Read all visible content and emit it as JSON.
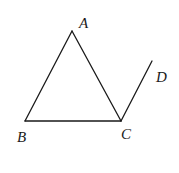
{
  "diagram": {
    "type": "geometry",
    "stroke_color": "#1a1a1a",
    "background": "#ffffff",
    "points": {
      "A": {
        "label": "A",
        "x": 72,
        "y": 31,
        "label_x": 79,
        "label_y": 28
      },
      "B": {
        "label": "B",
        "x": 25,
        "y": 121,
        "label_x": 17,
        "label_y": 142
      },
      "C": {
        "label": "C",
        "x": 121,
        "y": 121,
        "label_x": 121,
        "label_y": 139
      },
      "D": {
        "label": "D",
        "x": 152,
        "y": 61,
        "label_x": 156,
        "label_y": 82
      }
    },
    "segments": [
      {
        "from": "A",
        "to": "B"
      },
      {
        "from": "B",
        "to": "C"
      },
      {
        "from": "C",
        "to": "A"
      },
      {
        "from": "C",
        "to": "D"
      }
    ]
  }
}
